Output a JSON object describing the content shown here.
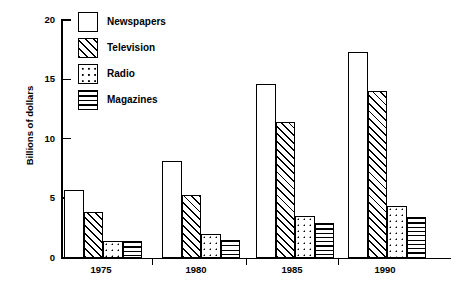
{
  "chart_data": {
    "type": "bar",
    "title": "",
    "subtitle": "",
    "xlabel": "",
    "ylabel": "Billions of dollars",
    "categories": [
      "1975",
      "1980",
      "1985",
      "1990"
    ],
    "series": [
      {
        "name": "Newspapers",
        "pattern": "blank",
        "values": [
          5.7,
          8.1,
          14.6,
          17.3
        ]
      },
      {
        "name": "Television",
        "pattern": "diagonal",
        "values": [
          3.8,
          5.3,
          11.4,
          14.0
        ]
      },
      {
        "name": "Radio",
        "pattern": "dots",
        "values": [
          1.4,
          2.0,
          3.5,
          4.3
        ]
      },
      {
        "name": "Magazines",
        "pattern": "horizontal",
        "values": [
          1.4,
          1.5,
          2.9,
          3.4
        ]
      }
    ],
    "ylim": [
      0,
      20
    ],
    "yticks": [
      0,
      5,
      10,
      15,
      20
    ],
    "ytick_labels": [
      "0",
      "5",
      "10",
      "15",
      "20"
    ],
    "grid": false,
    "legend_position": "top-left",
    "legend_entries": [
      "Newspapers",
      "Television",
      "Radio",
      "Magazines"
    ],
    "colors": {
      "ink": "#000000",
      "background": "#ffffff",
      "bar_fill": "#ffffff"
    }
  },
  "axis": {
    "y_title": "Billions of dollars",
    "y_labels": [
      "20",
      "15",
      "10",
      "5",
      "0"
    ],
    "x_labels": [
      "1975",
      "1980",
      "1985",
      "1990"
    ]
  },
  "legend": {
    "items": [
      {
        "label": "Newspapers"
      },
      {
        "label": "Television"
      },
      {
        "label": "Radio"
      },
      {
        "label": "Magazines"
      }
    ]
  }
}
